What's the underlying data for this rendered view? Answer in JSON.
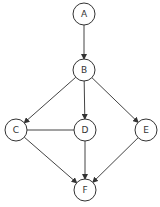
{
  "diagram": {
    "type": "directed-graph",
    "nodes": [
      {
        "id": "A",
        "label": "A",
        "cx": 84,
        "cy": 14
      },
      {
        "id": "B",
        "label": "B",
        "cx": 84,
        "cy": 70
      },
      {
        "id": "C",
        "label": "C",
        "cx": 16,
        "cy": 130
      },
      {
        "id": "D",
        "label": "D",
        "cx": 85,
        "cy": 130
      },
      {
        "id": "E",
        "label": "E",
        "cx": 146,
        "cy": 130
      },
      {
        "id": "F",
        "label": "F",
        "cx": 85,
        "cy": 190
      }
    ],
    "edges": [
      {
        "from": "A",
        "to": "B",
        "directed": true
      },
      {
        "from": "B",
        "to": "C",
        "directed": true
      },
      {
        "from": "B",
        "to": "D",
        "directed": true
      },
      {
        "from": "B",
        "to": "E",
        "directed": true
      },
      {
        "from": "C",
        "to": "D",
        "directed": false
      },
      {
        "from": "C",
        "to": "F",
        "directed": true
      },
      {
        "from": "D",
        "to": "F",
        "directed": true
      },
      {
        "from": "E",
        "to": "F",
        "directed": true
      }
    ],
    "colors": {
      "stroke": "#333333",
      "background": "#ffffff"
    }
  }
}
